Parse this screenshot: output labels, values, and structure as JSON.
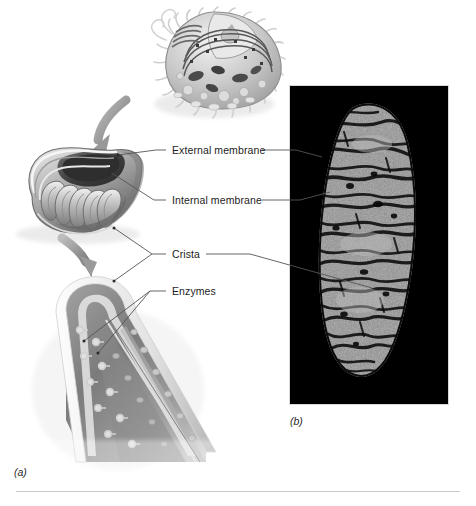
{
  "figure": {
    "background_color": "#ffffff",
    "captions": {
      "a": "(a)",
      "b": "(b)"
    },
    "rule_color": "#c9c9c9"
  },
  "labels": {
    "external_membrane": "External membrane",
    "internal_membrane": "Internal membrane",
    "crista": "Crista",
    "enzymes": "Enzymes"
  },
  "panel_a": {
    "name": "illustration-panel",
    "items": [
      {
        "name": "animal-cell-cutaway",
        "description": "Cutaway animal cell showing nucleus, endoplasmic reticulum and mitochondria"
      },
      {
        "name": "mitochondrion-cutaway",
        "description": "Cutaway mitochondrion showing outer membrane, inner membrane and cristae"
      },
      {
        "name": "crista-detail",
        "description": "Magnified crista surface showing enzyme particles"
      }
    ],
    "arrows": [
      {
        "name": "arrow-cell-to-mitochondrion",
        "color": "#9a9a9a"
      },
      {
        "name": "arrow-mitochondrion-to-crista",
        "color": "#9a9a9a"
      }
    ]
  },
  "panel_b": {
    "name": "electron-micrograph-panel",
    "background_color": "#000000",
    "subject": "Transmission electron micrograph of a mitochondrion",
    "left": 290,
    "top": 86,
    "width": 158,
    "height": 318
  },
  "leader_lines": {
    "color": "#555555",
    "count": 8
  }
}
